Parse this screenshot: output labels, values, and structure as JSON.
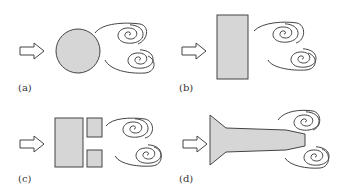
{
  "panels": [
    {
      "id": "a",
      "label": "(a)",
      "shape": "circle",
      "description": "Flow past a circular cylinder with vortex shedding"
    },
    {
      "id": "b",
      "label": "(b)",
      "shape": "rectangle",
      "description": "Flow past a flat plate / rectangular body with vortex shedding"
    },
    {
      "id": "c",
      "label": "(c)",
      "shape": "split-rectangle",
      "description": "Flow past a rectangular body with two trailing blocks and vortex shedding"
    },
    {
      "id": "d",
      "label": "(d)",
      "shape": "tapered-body",
      "description": "Flow past a streamlined tapered body with vortex shedding"
    }
  ],
  "colors": {
    "body_fill": "#d6d6d6",
    "stroke": "#444444",
    "background": "#ffffff"
  },
  "icons": {
    "flow_arrow": "hollow-right-arrow",
    "vortex": "spiral"
  }
}
